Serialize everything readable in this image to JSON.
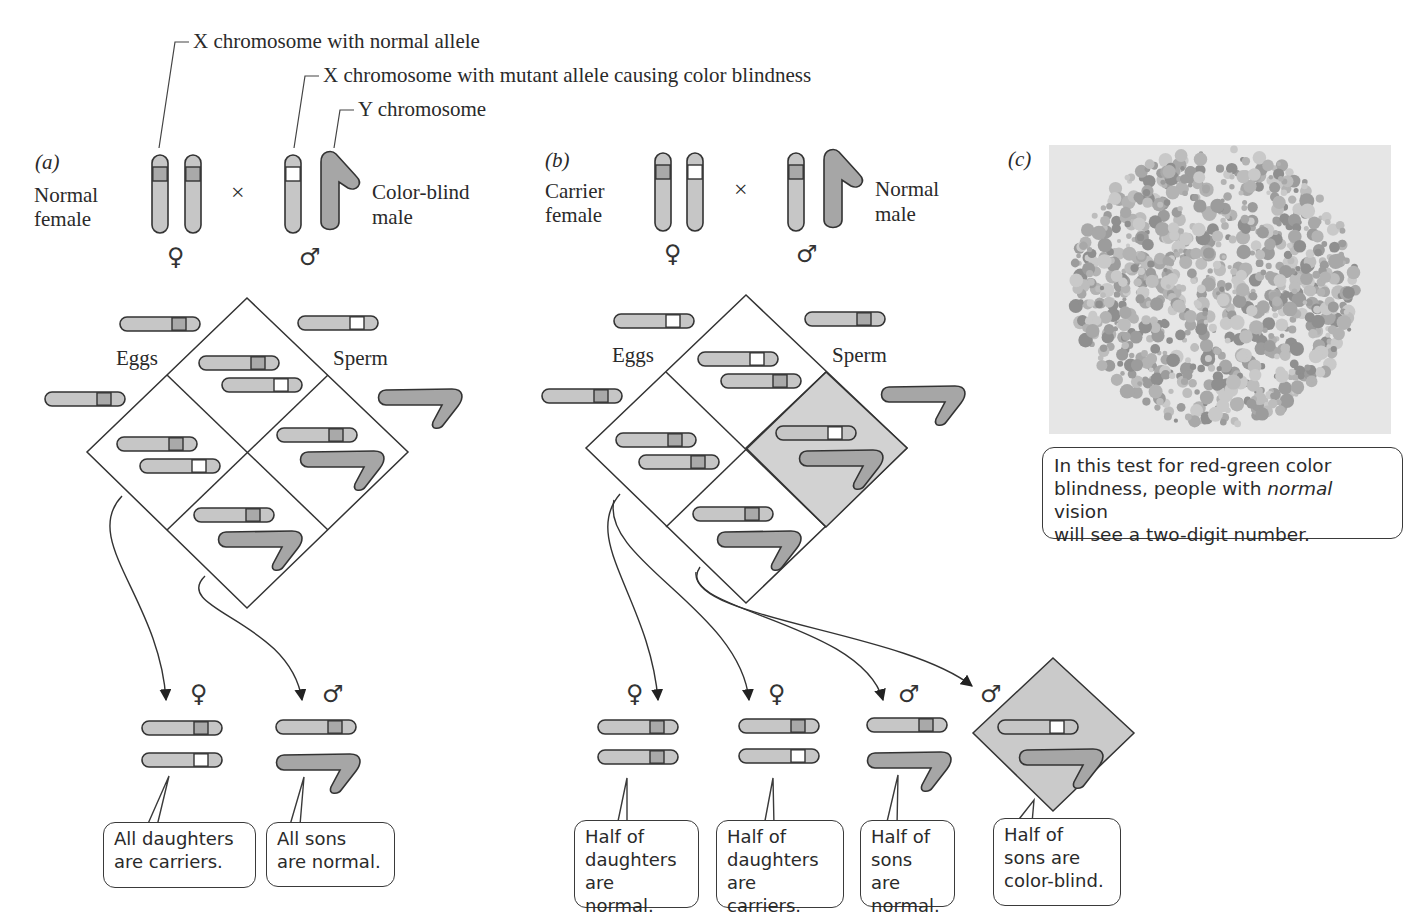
{
  "colors": {
    "chromosome_x": "#c6c6c6",
    "chromosome_y": "#a6a6a6",
    "normal_allele_band": "#a9a9a9",
    "mutant_allele_band": "#ffffff",
    "outline": "#333333",
    "highlight_cell": "#d2d2d2",
    "plate_background": "#e6e6e6"
  },
  "legend": {
    "x_normal": "X chromosome with normal allele",
    "x_mutant": "X chromosome with mutant allele causing color blindness",
    "y_chromosome": "Y chromosome"
  },
  "panel_a": {
    "tag": "(a)",
    "female_label_line1": "Normal",
    "female_label_line2": "female",
    "male_label_line1": "Color-blind",
    "male_label_line2": "male",
    "cross_symbol": "×",
    "female_symbol": "♀",
    "male_symbol": "♂",
    "eggs_label": "Eggs",
    "sperm_label": "Sperm",
    "offspring": [
      {
        "sex_symbol": "♀",
        "chromosomes": [
          "X-normal",
          "X-mutant"
        ],
        "caption_line1": "All daughters",
        "caption_line2": "are carriers."
      },
      {
        "sex_symbol": "♂",
        "chromosomes": [
          "X-normal",
          "Y"
        ],
        "caption_line1": "All sons",
        "caption_line2": "are normal."
      }
    ]
  },
  "panel_b": {
    "tag": "(b)",
    "female_label_line1": "Carrier",
    "female_label_line2": "female",
    "male_label_line1": "Normal",
    "male_label_line2": "male",
    "cross_symbol": "×",
    "female_symbol": "♀",
    "male_symbol": "♂",
    "eggs_label": "Eggs",
    "sperm_label": "Sperm",
    "offspring": [
      {
        "sex_symbol": "♀",
        "chromosomes": [
          "X-normal",
          "X-normal"
        ],
        "caption_line1": "Half of",
        "caption_line2": "daughters",
        "caption_line3": "are normal."
      },
      {
        "sex_symbol": "♀",
        "chromosomes": [
          "X-normal",
          "X-mutant"
        ],
        "caption_line1": "Half of",
        "caption_line2": "daughters",
        "caption_line3": "are carriers."
      },
      {
        "sex_symbol": "♂",
        "chromosomes": [
          "X-normal",
          "Y"
        ],
        "caption_line1": "Half of",
        "caption_line2": "sons are",
        "caption_line3": "normal."
      },
      {
        "sex_symbol": "♂",
        "chromosomes": [
          "X-mutant",
          "Y"
        ],
        "highlighted": true,
        "caption_line1": "Half of",
        "caption_line2": "sons are",
        "caption_line3": "color-blind."
      }
    ]
  },
  "panel_c": {
    "tag": "(c)",
    "caption_line1": "In this test for red-green color",
    "caption_line2_pre": "blindness, people with ",
    "caption_line2_em": "normal",
    "caption_line2_post": " vision",
    "caption_line3": "will see a two-digit number."
  }
}
